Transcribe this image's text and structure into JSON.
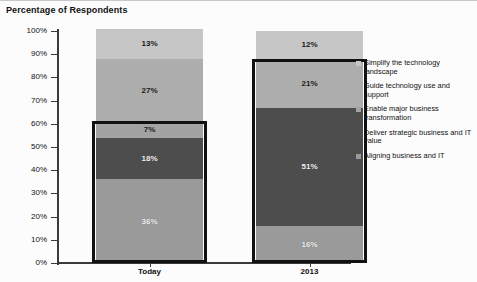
{
  "chart_data": {
    "type": "bar",
    "subtype": "stacked-100",
    "title": "Percentage of Respondents",
    "xlabel": "",
    "ylabel": "",
    "ylim": [
      0,
      100
    ],
    "ytick_labels": [
      "100%",
      "90%",
      "80%",
      "70%",
      "60%",
      "50%",
      "40%",
      "30%",
      "20%",
      "10%",
      "0%"
    ],
    "ytick_values": [
      100,
      90,
      80,
      70,
      60,
      50,
      40,
      30,
      20,
      10,
      0
    ],
    "grid": false,
    "legend_position": "right",
    "categories": [
      "Today",
      "2013"
    ],
    "series": [
      {
        "name": "Aligning business and IT",
        "color": "#9a9a9a",
        "values": [
          36,
          16
        ],
        "labels": [
          "36%",
          "16%"
        ]
      },
      {
        "name": "Deliver strategic business and IT value",
        "color": "#4d4d4d",
        "values": [
          18,
          51
        ],
        "labels": [
          "18%",
          "51%"
        ]
      },
      {
        "name": "Enable major business transformation",
        "color": "#a3a3a3",
        "values": [
          7,
          0
        ],
        "labels": [
          "7%",
          ""
        ]
      },
      {
        "name": "Guide technology use and support",
        "color": "#adadad",
        "values": [
          27,
          21
        ],
        "labels": [
          "27%",
          "21%"
        ]
      },
      {
        "name": "Simplify the technology landscape",
        "color": "#c6c6c6",
        "values": [
          13,
          12
        ],
        "labels": [
          "13%",
          "12%"
        ]
      }
    ],
    "annotations": [
      {
        "name": "highlight-today",
        "category": "Today",
        "from": 0,
        "to": 61,
        "style": "black-rectangle"
      },
      {
        "name": "highlight-2013",
        "category": "2013",
        "from": 0,
        "to": 88,
        "style": "black-rectangle"
      }
    ]
  },
  "legend": {
    "items": [
      {
        "label": "Simplify the technology landscape",
        "color": "#c6c6c6"
      },
      {
        "label": "Guide technology use and support",
        "color": "#adadad"
      },
      {
        "label": "Enable major business transformation",
        "color": "#a3a3a3"
      },
      {
        "label": "Deliver strategic business and IT value",
        "color": "#4d4d4d"
      },
      {
        "label": "Aligning business and IT",
        "color": "#9a9a9a"
      }
    ]
  }
}
